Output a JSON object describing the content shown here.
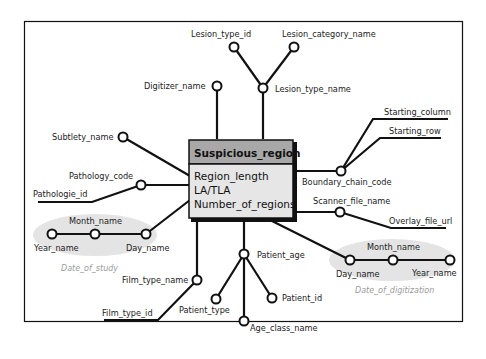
{
  "entity": {
    "title": "Suspicious_region",
    "attributes": [
      "Region_length",
      "LA/TLA",
      "Number_of_regions"
    ],
    "header_color": "#a8a8a8",
    "body_color": "#e6e6e6"
  },
  "nodes": {
    "lesion_type_id": "Lesion_type_id",
    "lesion_category_name": "Lesion_category_name",
    "lesion_type_name": "Lesion_type_name",
    "digitizer_name": "Digitizer_name",
    "subtlety_name": "Subtlety_name",
    "pathology_code": "Pathology_code",
    "pathologie_id": "Pathologie_id",
    "starting_column": "Starting_column",
    "starting_row": "Starting_row",
    "boundary_chain_code": "Boundary_chain_code",
    "scanner_file_name": "Scanner_file_name",
    "overlay_file_url": "Overlay_file_url",
    "film_type_name": "Film_type_name",
    "film_type_id": "Film_type_id",
    "patient_age": "Patient_age",
    "patient_type": "Patient_type",
    "patient_id": "Patient_id",
    "age_class_name": "Age_class_name"
  },
  "groups": {
    "date_of_study": {
      "label": "Date_of_study",
      "month": "Month_name",
      "year": "Year_name",
      "day": "Day_name"
    },
    "date_of_digitization": {
      "label": "Date_of_digitization",
      "month": "Month_name",
      "year": "Year_name",
      "day": "Day_name"
    }
  }
}
